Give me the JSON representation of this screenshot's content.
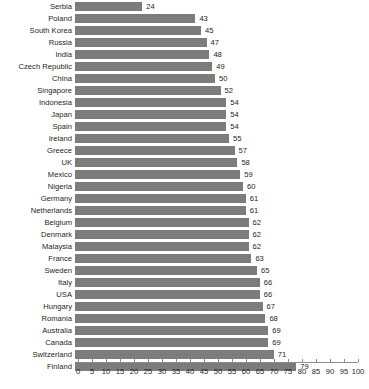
{
  "chart_data": {
    "type": "bar",
    "orientation": "horizontal",
    "title": "",
    "subtitle": "",
    "xlabel": "",
    "ylabel": "",
    "xlim": [
      0,
      100
    ],
    "xticks": [
      0,
      5,
      10,
      15,
      20,
      25,
      30,
      35,
      40,
      45,
      50,
      55,
      60,
      65,
      70,
      75,
      80,
      85,
      90,
      95,
      100
    ],
    "grid": false,
    "legend": false,
    "bar_color": "#7c7c7c",
    "text_color": "#231f20",
    "axis_color": "#8d8d8d",
    "show_value_labels": true,
    "categories": [
      "Serbia",
      "Poland",
      "South Korea",
      "Russia",
      "India",
      "Czech Republic",
      "China",
      "Singapore",
      "Indonesia",
      "Japan",
      "Spain",
      "Ireland",
      "Greece",
      "UK",
      "Mexico",
      "Nigeria",
      "Germany",
      "Netherlands",
      "Belgium",
      "Denmark",
      "Malaysia",
      "France",
      "Sweden",
      "Italy",
      "USA",
      "Hungary",
      "Romania",
      "Australia",
      "Canada",
      "Switzerland",
      "Finland"
    ],
    "values": [
      24,
      43,
      45,
      47,
      48,
      49,
      50,
      52,
      54,
      54,
      54,
      55,
      57,
      58,
      59,
      60,
      61,
      61,
      62,
      62,
      62,
      63,
      65,
      66,
      66,
      67,
      68,
      69,
      69,
      71,
      79
    ]
  }
}
